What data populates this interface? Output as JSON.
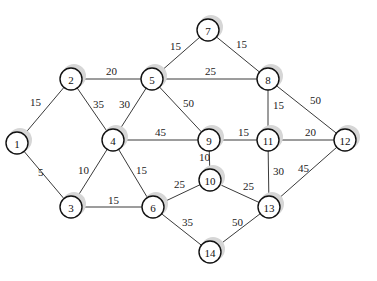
{
  "graph": {
    "type": "weighted-undirected-graph",
    "nodes": [
      {
        "id": "1",
        "x": 17,
        "y": 143
      },
      {
        "id": "2",
        "x": 71,
        "y": 79
      },
      {
        "id": "3",
        "x": 71,
        "y": 207
      },
      {
        "id": "4",
        "x": 113,
        "y": 140
      },
      {
        "id": "5",
        "x": 152,
        "y": 79
      },
      {
        "id": "6",
        "x": 153,
        "y": 207
      },
      {
        "id": "7",
        "x": 208,
        "y": 30
      },
      {
        "id": "8",
        "x": 268,
        "y": 79
      },
      {
        "id": "9",
        "x": 209,
        "y": 140
      },
      {
        "id": "10",
        "x": 210,
        "y": 180
      },
      {
        "id": "11",
        "x": 268,
        "y": 140
      },
      {
        "id": "12",
        "x": 345,
        "y": 140
      },
      {
        "id": "13",
        "x": 269,
        "y": 207
      },
      {
        "id": "14",
        "x": 210,
        "y": 252
      }
    ],
    "edges": [
      {
        "from": "1",
        "to": "2",
        "weight": "15",
        "lx": 30,
        "ly": 106
      },
      {
        "from": "1",
        "to": "3",
        "weight": "5",
        "lx": 38,
        "ly": 176
      },
      {
        "from": "2",
        "to": "5",
        "weight": "20",
        "lx": 106,
        "ly": 75
      },
      {
        "from": "2",
        "to": "4",
        "weight": "35",
        "lx": 93,
        "ly": 108
      },
      {
        "from": "3",
        "to": "4",
        "weight": "10",
        "lx": 78,
        "ly": 174
      },
      {
        "from": "3",
        "to": "6",
        "weight": "15",
        "lx": 108,
        "ly": 204
      },
      {
        "from": "4",
        "to": "5",
        "weight": "30",
        "lx": 119,
        "ly": 108
      },
      {
        "from": "4",
        "to": "6",
        "weight": "15",
        "lx": 136,
        "ly": 174
      },
      {
        "from": "4",
        "to": "9",
        "weight": "45",
        "lx": 155,
        "ly": 136
      },
      {
        "from": "5",
        "to": "7",
        "weight": "15",
        "lx": 170,
        "ly": 50
      },
      {
        "from": "5",
        "to": "8",
        "weight": "25",
        "lx": 205,
        "ly": 75
      },
      {
        "from": "5",
        "to": "9",
        "weight": "50",
        "lx": 183,
        "ly": 107
      },
      {
        "from": "6",
        "to": "10",
        "weight": "25",
        "lx": 174,
        "ly": 188
      },
      {
        "from": "6",
        "to": "14",
        "weight": "35",
        "lx": 182,
        "ly": 226
      },
      {
        "from": "7",
        "to": "8",
        "weight": "15",
        "lx": 236,
        "ly": 48
      },
      {
        "from": "8",
        "to": "11",
        "weight": "15",
        "lx": 273,
        "ly": 109
      },
      {
        "from": "8",
        "to": "12",
        "weight": "50",
        "lx": 310,
        "ly": 104
      },
      {
        "from": "9",
        "to": "11",
        "weight": "15",
        "lx": 238,
        "ly": 136
      },
      {
        "from": "9",
        "to": "10",
        "weight": "10",
        "lx": 199,
        "ly": 161
      },
      {
        "from": "10",
        "to": "13",
        "weight": "25",
        "lx": 243,
        "ly": 190
      },
      {
        "from": "11",
        "to": "12",
        "weight": "20",
        "lx": 305,
        "ly": 136
      },
      {
        "from": "11",
        "to": "13",
        "weight": "30",
        "lx": 273,
        "ly": 175
      },
      {
        "from": "12",
        "to": "13",
        "weight": "45",
        "lx": 298,
        "ly": 172
      },
      {
        "from": "13",
        "to": "14",
        "weight": "50",
        "lx": 232,
        "ly": 226
      }
    ]
  },
  "style": {
    "node_radius": 11,
    "edge_color": "#3a3a3a",
    "node_stroke": "#111111",
    "shadow_color": "#d6d6d6"
  }
}
